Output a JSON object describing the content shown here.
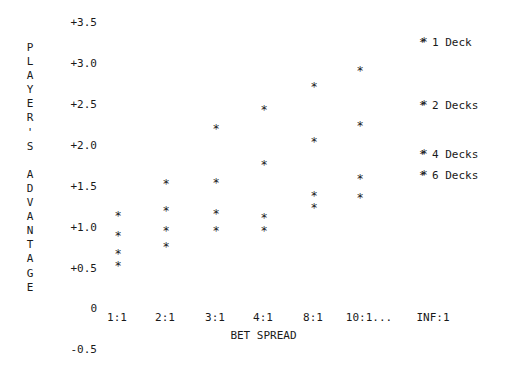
{
  "chart_data": {
    "type": "scatter",
    "title": "",
    "xlabel": "BET SPREAD",
    "ylabel": "PLAYER'S ADVANTAGE",
    "grid": false,
    "legend_position": "right",
    "marker": "*",
    "categories": [
      "1:1",
      "2:1",
      "3:1",
      "4:1",
      "8:1",
      "10:1...",
      "INF:1"
    ],
    "ytick_labels": [
      "+3.5",
      "+3.0",
      "+2.5",
      "+2.0",
      "+1.5",
      "+1.0",
      "+0.5",
      "0",
      "-0.5"
    ],
    "ytick_values": [
      3.5,
      3.0,
      2.5,
      2.0,
      1.5,
      1.0,
      0.5,
      0,
      -0.5
    ],
    "ylim": [
      -0.5,
      3.5
    ],
    "series": [
      {
        "name": "1 Deck",
        "values": [
          1.05,
          1.65,
          2.1,
          2.5,
          2.9,
          3.35,
          3.5
        ]
      },
      {
        "name": "2 Decks",
        "values": [
          0.8,
          1.2,
          1.55,
          2.1,
          2.55,
          2.7,
          2.55
        ]
      },
      {
        "name": "4 Decks",
        "values": [
          0.6,
          0.75,
          0.8,
          1.05,
          1.4,
          1.75,
          1.95
        ]
      },
      {
        "name": "6 Decks",
        "values": [
          0.45,
          0.6,
          0.75,
          0.9,
          1.3,
          1.55,
          1.7
        ]
      }
    ],
    "points": [
      {
        "series": "1 Deck",
        "x": "1:1",
        "y": 1.05
      },
      {
        "series": "2 Decks",
        "x": "1:1",
        "y": 0.8
      },
      {
        "series": "4 Decks",
        "x": "1:1",
        "y": 0.6
      },
      {
        "series": "6 Decks",
        "x": "1:1",
        "y": 0.45
      },
      {
        "series": "1 Deck",
        "x": "2:1",
        "y": 1.65
      },
      {
        "series": "2 Decks",
        "x": "2:1",
        "y": 1.2
      },
      {
        "series": "4 Decks",
        "x": "2:1",
        "y": 0.75
      },
      {
        "series": "6 Decks",
        "x": "2:1",
        "y": 0.6
      },
      {
        "series": "1 Deck",
        "x": "3:1",
        "y": 2.1
      },
      {
        "series": "2 Decks",
        "x": "3:1",
        "y": 1.55
      },
      {
        "series": "4 Decks",
        "x": "3:1",
        "y": 0.95
      },
      {
        "series": "6 Decks",
        "x": "3:1",
        "y": 0.75
      },
      {
        "series": "1 Deck",
        "x": "4:1",
        "y": 2.5
      },
      {
        "series": "2 Decks",
        "x": "4:1",
        "y": 2.1
      },
      {
        "series": "4 Decks",
        "x": "4:1",
        "y": 1.05
      },
      {
        "series": "6 Decks",
        "x": "4:1",
        "y": 0.9
      },
      {
        "series": "1 Deck",
        "x": "8:1",
        "y": 2.9
      },
      {
        "series": "2 Decks",
        "x": "8:1",
        "y": 2.55
      },
      {
        "series": "4 Decks",
        "x": "8:1",
        "y": 1.45
      },
      {
        "series": "6 Decks",
        "x": "8:1",
        "y": 1.3
      },
      {
        "series": "1 Deck",
        "x": "10:1...",
        "y": 3.35
      },
      {
        "series": "2 Decks",
        "x": "10:1...",
        "y": 2.7
      },
      {
        "series": "4 Decks",
        "x": "10:1...",
        "y": 1.75
      },
      {
        "series": "6 Decks",
        "x": "10:1...",
        "y": 1.55
      },
      {
        "series": "1 Deck",
        "x": "INF:1",
        "y": 3.5
      },
      {
        "series": "2 Decks",
        "x": "INF:1",
        "y": 2.55
      },
      {
        "series": "4 Decks",
        "x": "INF:1",
        "y": 1.95
      },
      {
        "series": "6 Decks",
        "x": "INF:1",
        "y": 1.7
      }
    ]
  },
  "axis": {
    "y_title_chars": [
      "P",
      "L",
      "A",
      "Y",
      "E",
      "R",
      "'",
      "S",
      " ",
      "A",
      "D",
      "V",
      "A",
      "N",
      "T",
      "A",
      "G",
      "E"
    ],
    "y_ticks": [
      {
        "label": "+3.5",
        "top": 17
      },
      {
        "label": "+3.0",
        "top": 58
      },
      {
        "label": "+2.5",
        "top": 99
      },
      {
        "label": "+2.0",
        "top": 140
      },
      {
        "label": "+1.5",
        "top": 181
      },
      {
        "label": "+1.0",
        "top": 222
      },
      {
        "label": "+0.5",
        "top": 263
      },
      {
        "label": "0",
        "top": 303
      },
      {
        "label": "-0.5",
        "top": 344
      }
    ],
    "x_ticks": [
      {
        "label": "1:1",
        "left": 117
      },
      {
        "label": "2:1",
        "left": 165
      },
      {
        "label": "3:1",
        "left": 215
      },
      {
        "label": "4:1",
        "left": 263
      },
      {
        "label": "8:1",
        "left": 313
      },
      {
        "label": "10:1...",
        "left": 369
      },
      {
        "label": "INF:1",
        "left": 433
      }
    ],
    "x_title": "BET SPREAD"
  },
  "legend": {
    "marker": "*",
    "items": [
      {
        "label": "1 Deck",
        "top": 36
      },
      {
        "label": "2 Decks",
        "top": 99
      },
      {
        "label": "4 Decks",
        "top": 148
      },
      {
        "label": "6 Decks",
        "top": 169
      }
    ]
  },
  "markers": [
    {
      "left": 113,
      "top": 210
    },
    {
      "left": 113,
      "top": 230
    },
    {
      "left": 113,
      "top": 248
    },
    {
      "left": 113,
      "top": 260
    },
    {
      "left": 161,
      "top": 178
    },
    {
      "left": 161,
      "top": 205
    },
    {
      "left": 161,
      "top": 225
    },
    {
      "left": 161,
      "top": 241
    },
    {
      "left": 211,
      "top": 123
    },
    {
      "left": 211,
      "top": 177
    },
    {
      "left": 211,
      "top": 208
    },
    {
      "left": 211,
      "top": 225
    },
    {
      "left": 259,
      "top": 104
    },
    {
      "left": 259,
      "top": 159
    },
    {
      "left": 259,
      "top": 212
    },
    {
      "left": 259,
      "top": 225
    },
    {
      "left": 309,
      "top": 81
    },
    {
      "left": 309,
      "top": 136
    },
    {
      "left": 309,
      "top": 190
    },
    {
      "left": 309,
      "top": 202
    },
    {
      "left": 355,
      "top": 65
    },
    {
      "left": 355,
      "top": 120
    },
    {
      "left": 355,
      "top": 173
    },
    {
      "left": 355,
      "top": 192
    },
    {
      "left": 419,
      "top": 36
    },
    {
      "left": 419,
      "top": 99
    },
    {
      "left": 419,
      "top": 148
    },
    {
      "left": 419,
      "top": 169
    }
  ]
}
